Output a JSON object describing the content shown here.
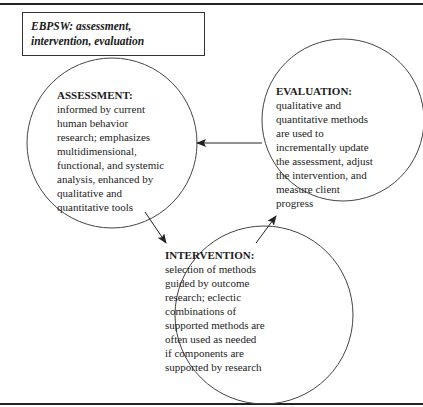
{
  "title_box": {
    "lines": [
      "EBPSW: assessment,",
      "intervention, evaluation"
    ]
  },
  "nodes": {
    "assessment": {
      "heading": "ASSESSMENT:",
      "lines": [
        "informed by current",
        "human behavior",
        "research; emphasizes",
        "multidimensional,",
        "functional, and systemic",
        "analysis, enhanced by",
        "qualitative and",
        "quantitative tools"
      ]
    },
    "evaluation": {
      "heading": "EVALUATION:",
      "lines": [
        "qualitative and",
        "quantitative methods",
        "are used to",
        "incrementally update",
        "the assessment, adjust",
        "the intervention, and",
        "measure client",
        "progress"
      ]
    },
    "intervention": {
      "heading": "INTERVENTION:",
      "lines": [
        "selection of methods",
        "guided by outcome",
        "research; eclectic",
        "combinations of",
        "supported methods are",
        "often used as needed",
        "if components are",
        "supported by research"
      ]
    }
  },
  "edges": [
    {
      "from": "assessment",
      "to": "intervention"
    },
    {
      "from": "intervention",
      "to": "evaluation"
    },
    {
      "from": "evaluation",
      "to": "assessment"
    }
  ],
  "colors": {
    "stroke": "#333333",
    "text": "#1c1c1c",
    "background": "#ffffff"
  }
}
